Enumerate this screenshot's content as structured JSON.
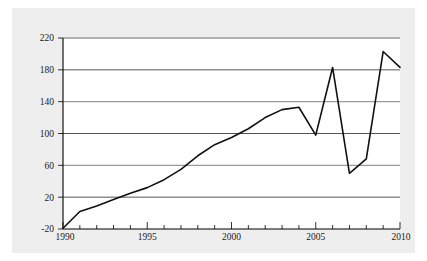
{
  "figure": {
    "background_color": "#eeeeee",
    "plot_background_color": "#ffffff",
    "line_color": "#111111",
    "gridline_color": "#555555",
    "axis_color": "#000000"
  },
  "chart_data": {
    "type": "line",
    "title": "",
    "subtitle": "",
    "xlabel": "",
    "ylabel": "",
    "xlim": [
      1990,
      2010
    ],
    "ylim": [
      -20,
      220
    ],
    "grid": true,
    "legend": "none",
    "y_ticks": [
      -20,
      20,
      60,
      100,
      140,
      180,
      220
    ],
    "y_tick_labels": [
      "-20",
      "20",
      "60",
      "100",
      "140",
      "180",
      "220"
    ],
    "x_ticks": [
      1990,
      1995,
      2000,
      2005,
      2010
    ],
    "x_tick_labels": [
      "1990",
      "1995",
      "2000",
      "2005",
      "2010"
    ],
    "x_minor_tick_interval": 1,
    "series": [
      {
        "name": "series-1",
        "x": [
          1990,
          1991,
          1992,
          1993,
          1994,
          1995,
          1996,
          1997,
          1998,
          1999,
          2000,
          2001,
          2002,
          2003,
          2004,
          2005,
          2006,
          2007,
          2008,
          2009,
          2010
        ],
        "values": [
          -19,
          2,
          9,
          17,
          25,
          32,
          42,
          55,
          72,
          86,
          95,
          106,
          120,
          130,
          133,
          98,
          183,
          50,
          68,
          203,
          183
        ]
      }
    ]
  }
}
